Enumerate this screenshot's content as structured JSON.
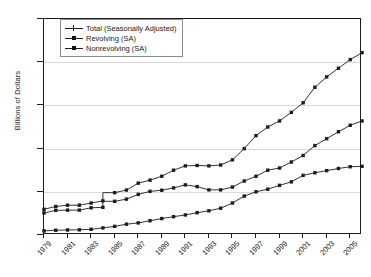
{
  "axis": {
    "ylabel": "Billions of Dollars",
    "yticks": [
      "0",
      "500",
      "1000",
      "1500",
      "2000",
      "2500"
    ],
    "xticks": [
      "1979",
      "1981",
      "1983",
      "1985",
      "1987",
      "1989",
      "1991",
      "1993",
      "1995",
      "1997",
      "1999",
      "2001",
      "2003",
      "2005"
    ]
  },
  "legend": [
    {
      "label": "Total (Seasonally Adjusted)",
      "marker": "plus"
    },
    {
      "label": "Revolving (SA)",
      "marker": "square"
    },
    {
      "label": "Nonrevolving (SA)",
      "marker": "square"
    }
  ],
  "colors": {
    "line": "#1d1d1d",
    "grid": "#d8d8d8",
    "frame": "#1d1d1d",
    "background": "#ffffff"
  },
  "chart_data": {
    "type": "line",
    "title": "",
    "xlabel": "",
    "ylabel": "Billions of Dollars",
    "ylim": [
      0,
      2500
    ],
    "xlim": [
      1979,
      2006
    ],
    "grid": true,
    "legend_position": "top-left",
    "x": [
      1979,
      1980,
      1981,
      1982,
      1983,
      1984,
      1985,
      1986,
      1987,
      1988,
      1989,
      1990,
      1991,
      1992,
      1993,
      1994,
      1995,
      1996,
      1997,
      1998,
      1999,
      2000,
      2001,
      2002,
      2003,
      2004,
      2005,
      2006
    ],
    "series": [
      {
        "name": "Total (Seasonally Adjusted)",
        "marker": "plus",
        "break_at": 1985,
        "values": [
          298,
          330,
          345,
          345,
          370,
          395,
          490,
          520,
          600,
          635,
          680,
          750,
          800,
          805,
          800,
          810,
          870,
          1000,
          1150,
          1250,
          1320,
          1420,
          1530,
          1710,
          1830,
          1930,
          2030,
          2110
        ]
      },
      {
        "name": "Revolving (SA)",
        "marker": "square",
        "values": [
          48,
          55,
          58,
          60,
          66,
          82,
          100,
          125,
          140,
          165,
          190,
          212,
          232,
          258,
          280,
          310,
          370,
          450,
          500,
          530,
          575,
          615,
          690,
          720,
          745,
          770,
          790,
          795
        ]
      },
      {
        "name": "Nonrevolving (SA)",
        "marker": "square",
        "break_at": 1985,
        "values": [
          255,
          285,
          288,
          288,
          315,
          320,
          390,
          415,
          470,
          505,
          518,
          545,
          580,
          560,
          522,
          522,
          555,
          625,
          680,
          750,
          775,
          845,
          920,
          1035,
          1115,
          1195,
          1270,
          1320
        ]
      }
    ]
  }
}
